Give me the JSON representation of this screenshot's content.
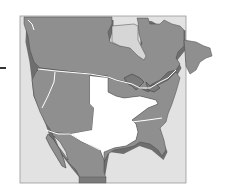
{
  "map": {
    "subject": "North America regional map",
    "colors": {
      "background": "#ffffff",
      "frame_fill": "#e2e2e2",
      "frame_stroke": "#9a9a9a",
      "land": "#8f8f8f",
      "land_shadow": "#6e6e6e",
      "coast_stroke": "#3f3f3f",
      "highlight_region": "#ffffff",
      "boundary": "#ffffff",
      "hudson_bay": "#d6d6d6"
    },
    "regions": [
      {
        "name": "Canada",
        "highlighted": false
      },
      {
        "name": "Western United States",
        "highlighted": false
      },
      {
        "name": "Central United States",
        "highlighted": true
      },
      {
        "name": "Eastern United States",
        "highlighted": false
      },
      {
        "name": "Mexico",
        "highlighted": false
      }
    ],
    "left_marker": "-"
  }
}
